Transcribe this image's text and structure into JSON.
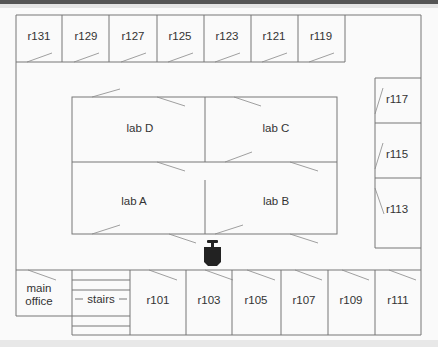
{
  "floorplan": {
    "top_rooms": [
      "r131",
      "r129",
      "r127",
      "r125",
      "r123",
      "r121",
      "r119"
    ],
    "labs": {
      "top_left": "lab D",
      "top_right": "lab C",
      "bottom_left": "lab A",
      "bottom_right": "lab B"
    },
    "right_rooms": [
      "r117",
      "r115",
      "r113"
    ],
    "bottom": {
      "office_line1": "main",
      "office_line2": "office",
      "stairs": "stairs",
      "rooms": [
        "r101",
        "r103",
        "r105",
        "r107",
        "r109",
        "r111"
      ]
    },
    "robot_icon": "robot-icon",
    "colors": {
      "wall": "#777777",
      "robot": "#222222",
      "background": "#fafafa"
    }
  }
}
